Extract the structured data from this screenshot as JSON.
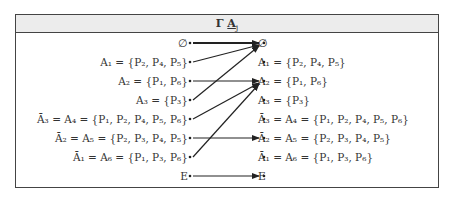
{
  "header": {
    "title": "Γ",
    "title_symbol": "A",
    "title_subscript": "j"
  },
  "left_items": [
    {
      "label": "∅"
    },
    {
      "label": "A₁ = {P₂, P₄, P₅}"
    },
    {
      "label": "A₂ = {P₁, P₆}"
    },
    {
      "label": "A₃ = {P₃}"
    },
    {
      "label": "Ā₃ = A₄ = {P₁, P₂, P₄, P₅, P₆}"
    },
    {
      "label": "Ā₂ = A₅ = {P₂, P₃, P₄, P₅}"
    },
    {
      "label": "Ā₁ = A₆ = {P₁, P₃, P₆}"
    },
    {
      "label": "E"
    }
  ],
  "right_items": [
    {
      "label": "∅"
    },
    {
      "label": "A₁ = {P₂, P₄, P₅}"
    },
    {
      "label": "A₂ = {P₁, P₆}"
    },
    {
      "label": "A₃ = {P₃}"
    },
    {
      "label": "Ā₃ = A₄ = {P₁, P₂, P₄, P₅, P₆}"
    },
    {
      "label": "Ā₂ = A₅ = {P₂, P₃, P₄, P₅}"
    },
    {
      "label": "Ā₁ = A₆ = {P₁, P₃, P₆}"
    },
    {
      "label": "E"
    }
  ],
  "mappings": [
    {
      "from": "∅",
      "to": "∅"
    },
    {
      "from": "A₁",
      "to": "∅"
    },
    {
      "from": "A₂",
      "to": "A₂"
    },
    {
      "from": "A₃",
      "to": "∅"
    },
    {
      "from": "Ā₃ = A₄",
      "to": "A₂"
    },
    {
      "from": "Ā₂ = A₅",
      "to": "Ā₂ = A₅"
    },
    {
      "from": "Ā₁ = A₆",
      "to": "A₂"
    },
    {
      "from": "E",
      "to": "E"
    }
  ],
  "colors": {
    "border": "#444444",
    "header_bg": "#ececec",
    "arrow": "#222222"
  }
}
